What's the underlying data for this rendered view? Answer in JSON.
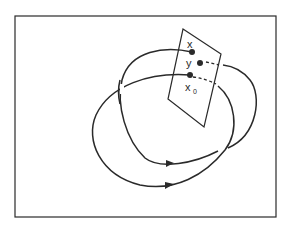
{
  "diagram": {
    "type": "poincare-return-map",
    "colors": {
      "stroke": "#2a2a2a",
      "background": "#ffffff"
    },
    "labels": {
      "x": "x",
      "y": "y",
      "x0": "x",
      "x0_subscript": "0"
    },
    "elements": [
      "frame",
      "section-plane",
      "outer-orbit",
      "inner-orbit",
      "point-x",
      "point-y",
      "point-x0",
      "direction-arrows"
    ]
  }
}
